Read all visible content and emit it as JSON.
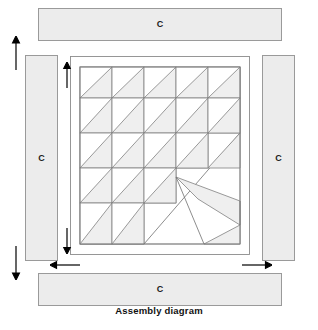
{
  "figure": {
    "title": "Assembly diagram",
    "colors": {
      "strip_fill": "#ececec",
      "strip_stroke": "#9a9a9a",
      "patch_fill": "#efefef",
      "patch_stroke": "#808080",
      "background": "#ffffff",
      "arrow": "#000000",
      "title_color": "#111111"
    }
  },
  "border_strips": [
    {
      "name": "top",
      "label": "C"
    },
    {
      "name": "right",
      "label": "C"
    },
    {
      "name": "bottom",
      "label": "C"
    },
    {
      "name": "left",
      "label": "C"
    }
  ],
  "center_block": {
    "grid_rows": 5,
    "grid_cols": 5,
    "unit": "half-square-triangle",
    "diagonal_direction": "bottom-left-to-top-right",
    "stepped_counts": [
      5,
      5,
      4,
      3,
      2
    ],
    "motif": "diagonal-bar-with-corner-triangles",
    "has_outer_frame": true
  },
  "arrows": {
    "left_outer": {
      "directions": [
        "up",
        "down"
      ],
      "orientation": "vertical"
    },
    "inner_left": {
      "directions": [
        "up",
        "down"
      ],
      "orientation": "vertical"
    },
    "bottom": {
      "directions": [
        "left",
        "right"
      ],
      "orientation": "horizontal"
    }
  }
}
